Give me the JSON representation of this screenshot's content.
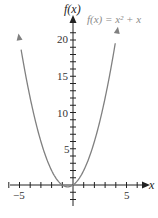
{
  "chart_data": {
    "type": "line",
    "title": "",
    "function_label": "f(x) = x² + x",
    "xlabel": "x",
    "ylabel": "f(x)",
    "xlim": [
      -6,
      7
    ],
    "ylim": [
      -3,
      22
    ],
    "x_ticks_labeled": [
      -5,
      5
    ],
    "x_tick_labels": [
      "−5",
      "5"
    ],
    "y_ticks_labeled": [
      5,
      10,
      15,
      20
    ],
    "y_tick_labels": [
      "5",
      "10",
      "15",
      "20"
    ],
    "x_tick_step": 1,
    "y_tick_step": 1,
    "grid": false,
    "legend": "none",
    "series": [
      {
        "name": "f(x) = x² + x",
        "formula": "x^2 + x",
        "x": [
          -5.1,
          -5,
          -4,
          -3,
          -2,
          -1,
          -0.5,
          0,
          1,
          2,
          3,
          4,
          4.2
        ],
        "values": [
          20.91,
          20,
          12,
          6,
          2,
          0,
          -0.25,
          0,
          2,
          6,
          12,
          20,
          21.84
        ],
        "color": "#808080"
      }
    ]
  },
  "colors": {
    "axis": "#222222",
    "curve": "#808080",
    "function_label": "#8a8a8a"
  }
}
